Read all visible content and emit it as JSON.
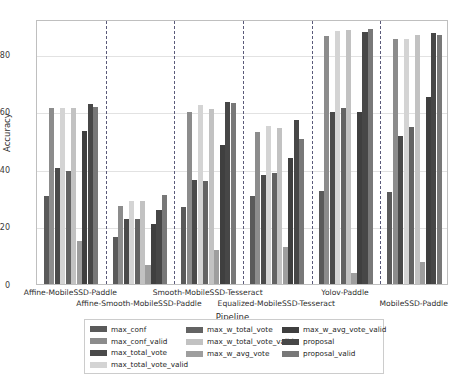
{
  "chart_data": {
    "type": "bar",
    "title": "",
    "xlabel": "Pipeline",
    "ylabel": "Accuracy",
    "ylim": [
      0,
      92
    ],
    "yticks": [
      0,
      20,
      40,
      60,
      80
    ],
    "grid": true,
    "legend_position": "below-axes",
    "legend_ncols": 3,
    "categories": [
      "Affine-MobileSSD-Paddle",
      "Affine-Smooth-MobileSSD-Paddle",
      "Smooth-MobileSSD-Tesseract",
      "Equalized-MobileSSD-Tesseract",
      "Yolov-Paddle",
      "MobileSSD-Paddle"
    ],
    "series": [
      {
        "name": "max_conf",
        "color": "#5a5a5a",
        "values": [
          30.5,
          16.2,
          26.8,
          30.5,
          32.3,
          31.8
        ]
      },
      {
        "name": "max_conf_valid",
        "color": "#8c8c8c",
        "values": [
          61.0,
          27.0,
          59.8,
          52.7,
          86.1,
          85.0
        ]
      },
      {
        "name": "max_total_vote",
        "color": "#4a4a4a",
        "values": [
          40.2,
          22.5,
          36.0,
          37.8,
          59.8,
          51.5
        ]
      },
      {
        "name": "max_total_vote_valid",
        "color": "#d4d4d4",
        "values": [
          61.0,
          28.8,
          62.2,
          55.0,
          87.9,
          84.9
        ]
      },
      {
        "name": "max_w_total_vote",
        "color": "#636363",
        "values": [
          39.3,
          22.4,
          35.9,
          38.7,
          61.0,
          54.4
        ]
      },
      {
        "name": "max_w_total_vote_valid",
        "color": "#c2c2c2",
        "values": [
          61.0,
          28.9,
          60.7,
          54.3,
          88.3,
          86.3
        ]
      },
      {
        "name": "max_w_avg_vote",
        "color": "#9e9e9e",
        "values": [
          15.0,
          6.7,
          11.9,
          13.0,
          3.8,
          7.8
        ]
      },
      {
        "name": "max_w_avg_vote_valid",
        "color": "#3f3f3f",
        "values": [
          53.2,
          20.7,
          48.3,
          43.8,
          59.6,
          64.8
        ]
      },
      {
        "name": "proposal",
        "color": "#474747",
        "values": [
          62.5,
          25.8,
          63.2,
          56.9,
          87.6,
          87.2
        ]
      },
      {
        "name": "proposal_valid",
        "color": "#787878",
        "values": [
          61.6,
          30.8,
          63.0,
          50.4,
          88.4,
          86.3
        ]
      }
    ]
  },
  "axes": {
    "ylabel": "Accuracy",
    "xlabel": "Pipeline",
    "yticks": [
      "0",
      "20",
      "40",
      "60",
      "80"
    ],
    "xticks": [
      "Affine-MobileSSD-Paddle",
      "Affine-Smooth-MobileSSD-Paddle",
      "Smooth-MobileSSD-Tesseract",
      "Equalized-MobileSSD-Tesseract",
      "Yolov-Paddle",
      "MobileSSD-Paddle"
    ]
  },
  "legend": {
    "columns": [
      [
        {
          "label": "max_conf",
          "color": "#5a5a5a"
        },
        {
          "label": "max_conf_valid",
          "color": "#8c8c8c"
        },
        {
          "label": "max_total_vote",
          "color": "#4a4a4a"
        },
        {
          "label": "max_total_vote_valid",
          "color": "#d4d4d4"
        }
      ],
      [
        {
          "label": "max_w_total_vote",
          "color": "#636363"
        },
        {
          "label": "max_w_total_vote_valid",
          "color": "#c2c2c2"
        },
        {
          "label": "max_w_avg_vote",
          "color": "#9e9e9e"
        }
      ],
      [
        {
          "label": "max_w_avg_vote_valid",
          "color": "#3f3f3f"
        },
        {
          "label": "proposal",
          "color": "#474747"
        },
        {
          "label": "proposal_valid",
          "color": "#787878"
        }
      ]
    ]
  }
}
